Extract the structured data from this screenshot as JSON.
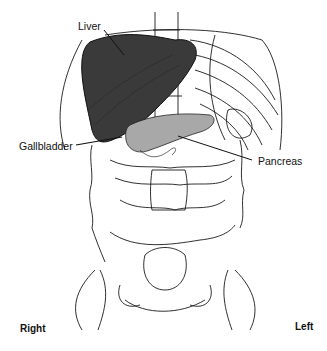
{
  "figure": {
    "type": "anatomical-diagram",
    "view": "anterior abdomen",
    "labels": {
      "liver": "Liver",
      "gallbladder": "Gallbladder",
      "pancreas": "Pancreas",
      "right": "Right",
      "left": "Left"
    },
    "colors": {
      "liver": "#3a3a3a",
      "pancreas": "#a8a8a8",
      "line": "#1a1a1a",
      "background": "#ffffff"
    }
  }
}
